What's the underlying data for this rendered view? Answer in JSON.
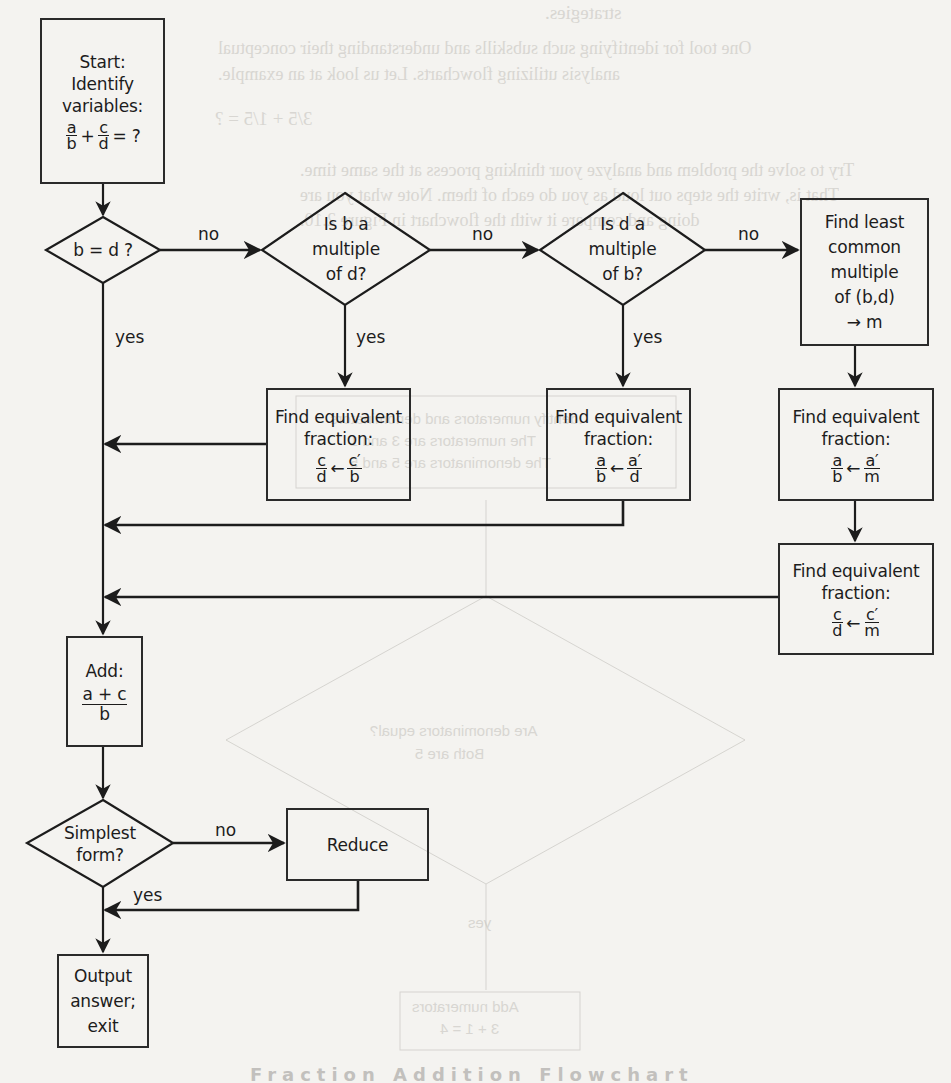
{
  "flowchart": {
    "title": "Fraction addition flowchart",
    "nodes": {
      "start": {
        "type": "process",
        "lines": [
          "Start:",
          "Identify",
          "variables:"
        ],
        "math": {
          "f1_num": "a",
          "f1_den": "b",
          "op": "+",
          "f2_num": "c",
          "f2_den": "d",
          "tail": "= ?"
        }
      },
      "q_equal": {
        "type": "decision",
        "lines": [
          "b = d ?"
        ]
      },
      "q_b_mult_d": {
        "type": "decision",
        "lines": [
          "Is b a",
          "multiple",
          "of d?"
        ]
      },
      "q_d_mult_b": {
        "type": "decision",
        "lines": [
          "Is d a",
          "multiple",
          "of b?"
        ]
      },
      "lcm": {
        "type": "process",
        "lines": [
          "Find least",
          "common",
          "multiple",
          "of (b,d)",
          "→ m"
        ]
      },
      "equiv_c_b": {
        "type": "process",
        "lines": [
          "Find equivalent",
          "fraction:"
        ],
        "math": {
          "l_num": "c",
          "l_den": "d",
          "arrow": "←",
          "r_num": "c′",
          "r_den": "b"
        }
      },
      "equiv_a_d": {
        "type": "process",
        "lines": [
          "Find equivalent",
          "fraction:"
        ],
        "math": {
          "l_num": "a",
          "l_den": "b",
          "arrow": "←",
          "r_num": "a′",
          "r_den": "d"
        }
      },
      "equiv_a_m": {
        "type": "process",
        "lines": [
          "Find equivalent",
          "fraction:"
        ],
        "math": {
          "l_num": "a",
          "l_den": "b",
          "arrow": "←",
          "r_num": "a′",
          "r_den": "m"
        }
      },
      "equiv_c_m": {
        "type": "process",
        "lines": [
          "Find equivalent",
          "fraction:"
        ],
        "math": {
          "l_num": "c",
          "l_den": "d",
          "arrow": "←",
          "r_num": "c′",
          "r_den": "m"
        }
      },
      "add": {
        "type": "process",
        "lines": [
          "Add:"
        ],
        "math": {
          "num": "a + c",
          "den": "b"
        }
      },
      "q_simplest": {
        "type": "decision",
        "lines": [
          "Simplest",
          "form?"
        ]
      },
      "reduce": {
        "type": "process",
        "lines": [
          "Reduce"
        ]
      },
      "output": {
        "type": "terminal",
        "lines": [
          "Output",
          "answer;",
          "exit"
        ]
      }
    },
    "edge_labels": {
      "equal_no": "no",
      "equal_yes": "yes",
      "b_mult_no": "no",
      "b_mult_yes": "yes",
      "d_mult_no": "no",
      "d_mult_yes": "yes",
      "simplest_no": "no",
      "simplest_yes": "yes"
    },
    "colors": {
      "line": "#1c1c1c",
      "background": "#f4f3f0",
      "bleed_text": "#cfcdc8"
    }
  },
  "bleed_through": {
    "line1": "strategies.",
    "line2": "One tool for identifying such subskills and understanding their conceptual",
    "line3": "analysis utilizing flowcharts. Let us look at an example.",
    "line4": "3/5 + 1/5 = ?",
    "line5": "Try to solve the problem and analyze your thinking process at the same time.",
    "line6": "That is, write the steps out loud as you do each of them. Note what you are",
    "line7": "doing and compare it with the flowchart in Figure 2.10.",
    "box1": "Identify numerators and denominators",
    "box2": "The numerators are 3 and 1",
    "box3": "The denominators are 5 and 5",
    "diamond1": "Are denominators equal?",
    "diamond2": "Both are 5",
    "yes": "yes",
    "box4": "Add numerators",
    "box5": "3 + 1 = 4"
  },
  "caption": {
    "text": "Fraction Addition Flowchart"
  }
}
